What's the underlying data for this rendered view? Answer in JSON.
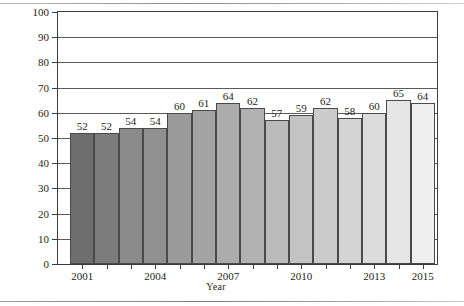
{
  "chart_data": {
    "type": "bar",
    "title": "",
    "xlabel": "Year",
    "ylabel": "Percentage",
    "ylim": [
      0,
      100
    ],
    "ytick_step": 10,
    "yticks": [
      0,
      10,
      20,
      30,
      40,
      50,
      60,
      70,
      80,
      90,
      100
    ],
    "grid": true,
    "legend": "none",
    "categories": [
      "2001",
      "2002",
      "2003",
      "2004",
      "2005",
      "2006",
      "2007",
      "2008",
      "2009",
      "2010",
      "2011",
      "2012",
      "2013",
      "2014",
      "2015"
    ],
    "xtick_labels_shown": [
      "2001",
      "2004",
      "2007",
      "2010",
      "2013",
      "2015"
    ],
    "values": [
      52,
      52,
      54,
      54,
      60,
      61,
      64,
      62,
      57,
      59,
      62,
      58,
      60,
      65,
      64
    ],
    "bar_colors": [
      "#6e6e6e",
      "#7c7c7c",
      "#8a8a8a",
      "#909090",
      "#9a9a9a",
      "#a3a3a3",
      "#ababab",
      "#b2b2b2",
      "#bbbbbb",
      "#c3c3c3",
      "#cbcbcb",
      "#d4d4d4",
      "#dcdcdc",
      "#e6e6e6",
      "#efefef"
    ]
  },
  "style": {
    "axis_color": "#3d3d3d",
    "grid_color": "#5a5a5a",
    "text_color": "#231f20",
    "background": "#ffffff"
  }
}
